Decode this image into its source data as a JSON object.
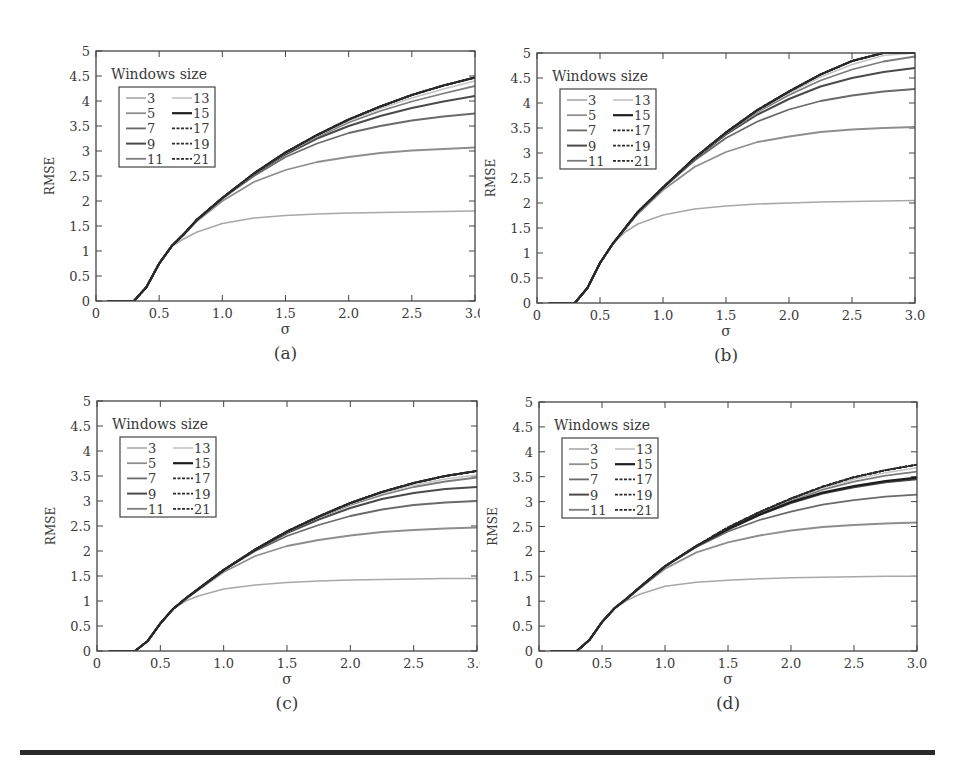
{
  "figure": {
    "panels_layout": "2x2",
    "bottom_rule": true
  },
  "chart_data": [
    {
      "id": "a",
      "type": "line",
      "caption": "(a)",
      "xlabel": "σ",
      "ylabel": "RMSE",
      "xlim": [
        0,
        3.0
      ],
      "ylim": [
        0,
        5
      ],
      "xticks": [
        "0",
        "0.5",
        "1.0",
        "1.5",
        "2.0",
        "2.5",
        "3.0"
      ],
      "yticks": [
        "0",
        "0.5",
        "1",
        "1.5",
        "2",
        "2.5",
        "3",
        "3.5",
        "4",
        "4.5",
        "5"
      ],
      "grid": false,
      "legend": {
        "title": "Windows size",
        "position": "upper-left",
        "entries": [
          "3",
          "5",
          "7",
          "9",
          "11",
          "13",
          "15",
          "17",
          "19",
          "21"
        ]
      },
      "x": [
        0.1,
        0.3,
        0.4,
        0.5,
        0.6,
        0.7,
        0.8,
        1.0,
        1.25,
        1.5,
        1.75,
        2.0,
        2.25,
        2.5,
        2.75,
        3.0
      ],
      "series": [
        {
          "name": "3",
          "values": [
            0,
            0,
            0.28,
            0.75,
            1.1,
            1.25,
            1.38,
            1.55,
            1.66,
            1.71,
            1.74,
            1.76,
            1.77,
            1.78,
            1.79,
            1.8
          ]
        },
        {
          "name": "5",
          "values": [
            0,
            0,
            0.28,
            0.75,
            1.1,
            1.33,
            1.6,
            2.0,
            2.38,
            2.62,
            2.78,
            2.88,
            2.96,
            3.01,
            3.04,
            3.07
          ]
        },
        {
          "name": "7",
          "values": [
            0,
            0,
            0.28,
            0.75,
            1.1,
            1.35,
            1.62,
            2.05,
            2.5,
            2.88,
            3.15,
            3.36,
            3.5,
            3.61,
            3.69,
            3.75
          ]
        },
        {
          "name": "9",
          "values": [
            0,
            0,
            0.28,
            0.75,
            1.1,
            1.35,
            1.63,
            2.05,
            2.53,
            2.93,
            3.25,
            3.5,
            3.7,
            3.86,
            3.99,
            4.1
          ]
        },
        {
          "name": "11",
          "values": [
            0,
            0,
            0.28,
            0.75,
            1.1,
            1.35,
            1.63,
            2.06,
            2.54,
            2.95,
            3.28,
            3.57,
            3.8,
            3.99,
            4.15,
            4.3
          ]
        },
        {
          "name": "13",
          "values": [
            0,
            0,
            0.28,
            0.75,
            1.1,
            1.35,
            1.63,
            2.06,
            2.54,
            2.96,
            3.3,
            3.6,
            3.85,
            4.06,
            4.24,
            4.4
          ]
        },
        {
          "name": "15",
          "values": [
            0,
            0,
            0.28,
            0.75,
            1.1,
            1.35,
            1.63,
            2.06,
            2.55,
            2.97,
            3.32,
            3.63,
            3.89,
            4.12,
            4.31,
            4.47
          ]
        },
        {
          "name": "17",
          "values": [
            0,
            0,
            0.28,
            0.75,
            1.1,
            1.35,
            1.63,
            2.06,
            2.55,
            2.97,
            3.32,
            3.63,
            3.89,
            4.12,
            4.31,
            4.47
          ]
        },
        {
          "name": "19",
          "values": [
            0,
            0,
            0.28,
            0.75,
            1.1,
            1.35,
            1.63,
            2.06,
            2.55,
            2.97,
            3.32,
            3.63,
            3.89,
            4.12,
            4.31,
            4.47
          ]
        },
        {
          "name": "21",
          "values": [
            0,
            0,
            0.28,
            0.75,
            1.1,
            1.35,
            1.63,
            2.06,
            2.55,
            2.97,
            3.32,
            3.63,
            3.89,
            4.12,
            4.31,
            4.47
          ]
        }
      ]
    },
    {
      "id": "b",
      "type": "line",
      "caption": "(b)",
      "xlabel": "σ",
      "ylabel": "RMSE",
      "xlim": [
        0,
        3.0
      ],
      "ylim": [
        0,
        5
      ],
      "xticks": [
        "0",
        "0.5",
        "1.0",
        "1.5",
        "2.0",
        "2.5",
        "3.0"
      ],
      "yticks": [
        "0",
        "0.5",
        "1",
        "1.5",
        "2",
        "2.5",
        "3",
        "3.5",
        "4",
        "4.5",
        "5"
      ],
      "grid": false,
      "legend": {
        "title": "Windows size",
        "position": "upper-left",
        "entries": [
          "3",
          "5",
          "7",
          "9",
          "11",
          "13",
          "15",
          "17",
          "19",
          "21"
        ]
      },
      "x": [
        0.1,
        0.3,
        0.4,
        0.5,
        0.6,
        0.7,
        0.8,
        1.0,
        1.25,
        1.5,
        1.75,
        2.0,
        2.25,
        2.5,
        2.75,
        3.0
      ],
      "series": [
        {
          "name": "3",
          "values": [
            0,
            0,
            0.3,
            0.8,
            1.18,
            1.42,
            1.58,
            1.76,
            1.88,
            1.94,
            1.98,
            2.0,
            2.02,
            2.03,
            2.04,
            2.05
          ]
        },
        {
          "name": "5",
          "values": [
            0,
            0,
            0.3,
            0.8,
            1.18,
            1.48,
            1.78,
            2.26,
            2.72,
            3.02,
            3.22,
            3.33,
            3.42,
            3.47,
            3.5,
            3.52
          ]
        },
        {
          "name": "7",
          "values": [
            0,
            0,
            0.3,
            0.8,
            1.18,
            1.5,
            1.82,
            2.3,
            2.85,
            3.3,
            3.63,
            3.87,
            4.04,
            4.15,
            4.23,
            4.28
          ]
        },
        {
          "name": "9",
          "values": [
            0,
            0,
            0.3,
            0.8,
            1.18,
            1.5,
            1.82,
            2.31,
            2.88,
            3.37,
            3.77,
            4.08,
            4.33,
            4.5,
            4.62,
            4.7
          ]
        },
        {
          "name": "11",
          "values": [
            0,
            0,
            0.3,
            0.8,
            1.18,
            1.5,
            1.82,
            2.31,
            2.89,
            3.39,
            3.82,
            4.16,
            4.45,
            4.67,
            4.83,
            4.93
          ]
        },
        {
          "name": "13",
          "values": [
            0,
            0,
            0.3,
            0.8,
            1.18,
            1.5,
            1.82,
            2.31,
            2.89,
            3.4,
            3.84,
            4.2,
            4.52,
            4.77,
            4.95,
            5.0
          ]
        },
        {
          "name": "15",
          "values": [
            0,
            0,
            0.3,
            0.8,
            1.18,
            1.5,
            1.82,
            2.31,
            2.9,
            3.41,
            3.86,
            4.23,
            4.57,
            4.84,
            5.0,
            5.0
          ]
        },
        {
          "name": "17",
          "values": [
            0,
            0,
            0.3,
            0.8,
            1.18,
            1.5,
            1.82,
            2.31,
            2.9,
            3.41,
            3.86,
            4.23,
            4.57,
            4.84,
            5.0,
            5.0
          ]
        },
        {
          "name": "19",
          "values": [
            0,
            0,
            0.3,
            0.8,
            1.18,
            1.5,
            1.82,
            2.31,
            2.9,
            3.41,
            3.86,
            4.23,
            4.57,
            4.84,
            5.0,
            5.0
          ]
        },
        {
          "name": "21",
          "values": [
            0,
            0,
            0.3,
            0.8,
            1.18,
            1.5,
            1.82,
            2.31,
            2.9,
            3.41,
            3.86,
            4.23,
            4.57,
            4.84,
            5.0,
            5.0
          ]
        }
      ]
    },
    {
      "id": "c",
      "type": "line",
      "caption": "(c)",
      "xlabel": "σ",
      "ylabel": "RMSE",
      "xlim": [
        0,
        3.0
      ],
      "ylim": [
        0,
        5
      ],
      "xticks": [
        "0",
        "0.5",
        "1.0",
        "1.5",
        "2.0",
        "2.5",
        "3.0"
      ],
      "yticks": [
        "0",
        "0.5",
        "1",
        "1.5",
        "2",
        "2.5",
        "3",
        "3.5",
        "4",
        "4.5",
        "5"
      ],
      "grid": false,
      "legend": {
        "title": "Windows size",
        "position": "upper-left",
        "entries": [
          "3",
          "5",
          "7",
          "9",
          "11",
          "13",
          "15",
          "17",
          "19",
          "21"
        ]
      },
      "x": [
        0.1,
        0.3,
        0.4,
        0.5,
        0.6,
        0.7,
        0.8,
        1.0,
        1.25,
        1.5,
        1.75,
        2.0,
        2.25,
        2.5,
        2.75,
        3.0
      ],
      "series": [
        {
          "name": "3",
          "values": [
            0,
            0,
            0.2,
            0.55,
            0.84,
            1.0,
            1.1,
            1.24,
            1.32,
            1.37,
            1.4,
            1.42,
            1.43,
            1.44,
            1.45,
            1.45
          ]
        },
        {
          "name": "5",
          "values": [
            0,
            0,
            0.2,
            0.55,
            0.84,
            1.04,
            1.22,
            1.58,
            1.9,
            2.1,
            2.22,
            2.31,
            2.38,
            2.42,
            2.45,
            2.47
          ]
        },
        {
          "name": "7",
          "values": [
            0,
            0,
            0.2,
            0.55,
            0.84,
            1.05,
            1.24,
            1.62,
            2.0,
            2.3,
            2.52,
            2.7,
            2.83,
            2.92,
            2.97,
            3.0
          ]
        },
        {
          "name": "9",
          "values": [
            0,
            0,
            0.2,
            0.55,
            0.84,
            1.05,
            1.24,
            1.62,
            2.02,
            2.36,
            2.63,
            2.86,
            3.04,
            3.16,
            3.24,
            3.28
          ]
        },
        {
          "name": "11",
          "values": [
            0,
            0,
            0.2,
            0.55,
            0.84,
            1.05,
            1.24,
            1.62,
            2.03,
            2.38,
            2.67,
            2.92,
            3.12,
            3.28,
            3.39,
            3.47
          ]
        },
        {
          "name": "13",
          "values": [
            0,
            0,
            0.2,
            0.55,
            0.84,
            1.05,
            1.24,
            1.62,
            2.03,
            2.38,
            2.68,
            2.94,
            3.15,
            3.32,
            3.44,
            3.52
          ]
        },
        {
          "name": "15",
          "values": [
            0,
            0,
            0.2,
            0.55,
            0.84,
            1.05,
            1.24,
            1.62,
            2.03,
            2.39,
            2.69,
            2.96,
            3.18,
            3.36,
            3.5,
            3.6
          ]
        },
        {
          "name": "17",
          "values": [
            0,
            0,
            0.2,
            0.55,
            0.84,
            1.05,
            1.24,
            1.62,
            2.03,
            2.39,
            2.69,
            2.96,
            3.18,
            3.36,
            3.5,
            3.6
          ]
        },
        {
          "name": "19",
          "values": [
            0,
            0,
            0.2,
            0.55,
            0.84,
            1.05,
            1.24,
            1.62,
            2.03,
            2.39,
            2.69,
            2.96,
            3.18,
            3.36,
            3.5,
            3.6
          ]
        },
        {
          "name": "21",
          "values": [
            0,
            0,
            0.2,
            0.55,
            0.84,
            1.05,
            1.24,
            1.62,
            2.03,
            2.39,
            2.69,
            2.96,
            3.18,
            3.36,
            3.5,
            3.6
          ]
        }
      ]
    },
    {
      "id": "d",
      "type": "line",
      "caption": "(d)",
      "xlabel": "σ",
      "ylabel": "RMSE",
      "xlim": [
        0,
        3.0
      ],
      "ylim": [
        0,
        5
      ],
      "xticks": [
        "0",
        "0.5",
        "1.0",
        "1.5",
        "2.0",
        "2.5",
        "3.0"
      ],
      "yticks": [
        "0",
        "0.5",
        "1",
        "1.5",
        "2",
        "2.5",
        "3",
        "3.5",
        "4",
        "4.5",
        "5"
      ],
      "grid": false,
      "legend": {
        "title": "Windows size",
        "position": "upper-left",
        "entries": [
          "3",
          "5",
          "7",
          "9",
          "11",
          "13",
          "15",
          "17",
          "19",
          "21"
        ]
      },
      "x": [
        0.1,
        0.3,
        0.4,
        0.5,
        0.6,
        0.7,
        0.8,
        1.0,
        1.25,
        1.5,
        1.75,
        2.0,
        2.25,
        2.5,
        2.75,
        3.0
      ],
      "series": [
        {
          "name": "3",
          "values": [
            0,
            0,
            0.22,
            0.58,
            0.86,
            1.02,
            1.14,
            1.3,
            1.38,
            1.42,
            1.45,
            1.47,
            1.48,
            1.49,
            1.5,
            1.5
          ]
        },
        {
          "name": "5",
          "values": [
            0,
            0,
            0.22,
            0.58,
            0.86,
            1.05,
            1.26,
            1.65,
            1.98,
            2.18,
            2.32,
            2.42,
            2.49,
            2.53,
            2.56,
            2.58
          ]
        },
        {
          "name": "7",
          "values": [
            0,
            0,
            0.22,
            0.58,
            0.86,
            1.06,
            1.28,
            1.7,
            2.09,
            2.4,
            2.63,
            2.8,
            2.94,
            3.03,
            3.1,
            3.14
          ]
        },
        {
          "name": "9",
          "values": [
            0,
            0,
            0.22,
            0.58,
            0.86,
            1.06,
            1.28,
            1.7,
            2.1,
            2.44,
            2.73,
            2.97,
            3.16,
            3.29,
            3.39,
            3.45
          ]
        },
        {
          "name": "11",
          "values": [
            0,
            0,
            0.22,
            0.58,
            0.86,
            1.06,
            1.28,
            1.7,
            2.11,
            2.46,
            2.77,
            3.02,
            3.24,
            3.4,
            3.52,
            3.6
          ]
        },
        {
          "name": "13",
          "values": [
            0,
            0,
            0.22,
            0.58,
            0.86,
            1.06,
            1.28,
            1.7,
            2.11,
            2.47,
            2.78,
            3.04,
            3.27,
            3.45,
            3.58,
            3.68
          ]
        },
        {
          "name": "15",
          "values": [
            0,
            0,
            0.22,
            0.58,
            0.86,
            1.06,
            1.28,
            1.7,
            2.11,
            2.45,
            2.74,
            2.99,
            3.18,
            3.31,
            3.41,
            3.48
          ]
        },
        {
          "name": "17",
          "values": [
            0,
            0,
            0.22,
            0.58,
            0.86,
            1.06,
            1.28,
            1.7,
            2.11,
            2.48,
            2.79,
            3.06,
            3.3,
            3.49,
            3.63,
            3.74
          ]
        },
        {
          "name": "19",
          "values": [
            0,
            0,
            0.22,
            0.58,
            0.86,
            1.06,
            1.28,
            1.7,
            2.11,
            2.48,
            2.79,
            3.06,
            3.3,
            3.49,
            3.63,
            3.74
          ]
        },
        {
          "name": "21",
          "values": [
            0,
            0,
            0.22,
            0.58,
            0.86,
            1.06,
            1.28,
            1.7,
            2.11,
            2.48,
            2.79,
            3.06,
            3.3,
            3.49,
            3.63,
            3.74
          ]
        }
      ]
    }
  ],
  "series_styles": {
    "3": {
      "color": "#a8a8a8",
      "width": 1.6,
      "dash": ""
    },
    "5": {
      "color": "#8e8e8e",
      "width": 1.8,
      "dash": ""
    },
    "7": {
      "color": "#6a6a6a",
      "width": 1.8,
      "dash": ""
    },
    "9": {
      "color": "#4a4a4a",
      "width": 2.0,
      "dash": ""
    },
    "11": {
      "color": "#7c7c7c",
      "width": 1.8,
      "dash": ""
    },
    "13": {
      "color": "#c4c4c4",
      "width": 1.6,
      "dash": ""
    },
    "15": {
      "color": "#1e1e1e",
      "width": 2.2,
      "dash": ""
    },
    "17": {
      "color": "#2a2a2a",
      "width": 1.8,
      "dash": "4,2"
    },
    "19": {
      "color": "#2a2a2a",
      "width": 1.8,
      "dash": "4,2"
    },
    "21": {
      "color": "#2a2a2a",
      "width": 1.8,
      "dash": "4,2"
    }
  }
}
